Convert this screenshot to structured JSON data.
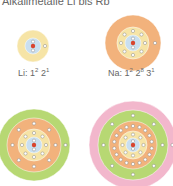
{
  "title": "Alkalimetalle Li bis Rb",
  "atoms": [
    {
      "symbol": "Li",
      "label_prefix": "Li: ",
      "config": [
        [
          "1",
          "2"
        ],
        [
          "2",
          "1"
        ]
      ]
    },
    {
      "symbol": "Na",
      "label_prefix": "Na: ",
      "config": [
        [
          "1",
          "2"
        ],
        [
          "2",
          "8"
        ],
        [
          "3",
          "1"
        ]
      ]
    },
    {
      "symbol": "K"
    },
    {
      "symbol": "Rb"
    }
  ],
  "colors": {
    "nucleus": "#d9442e",
    "shell1": "#c9dff0",
    "shell2": "#f6e4a6",
    "shell3": "#f2b27c",
    "shell4": "#b7d873",
    "shell5": "#f2b7cc",
    "electron": "#ffffff"
  }
}
